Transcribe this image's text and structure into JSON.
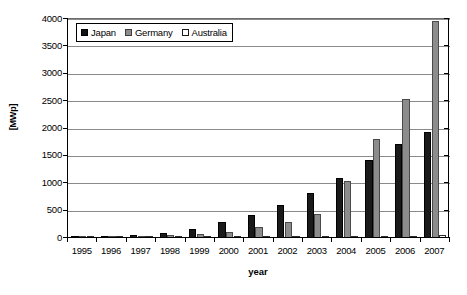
{
  "chart_data": {
    "type": "bar",
    "title": "",
    "xlabel": "year",
    "ylabel": "[MWp]",
    "ylim": [
      0,
      4000
    ],
    "ytick_step": 500,
    "yticks": [
      "4000",
      "3500",
      "3000",
      "2500",
      "2000",
      "1500",
      "1000",
      "500",
      "0"
    ],
    "grid": true,
    "legend_position": "top-left-inside",
    "categories": [
      "1995",
      "1996",
      "1997",
      "1998",
      "1999",
      "2000",
      "2001",
      "2002",
      "2003",
      "2004",
      "2005",
      "2006",
      "2007"
    ],
    "series": [
      {
        "name": "Japan",
        "color": "#1a1a1a",
        "values": [
          16,
          22,
          60,
          92,
          170,
          300,
          425,
          610,
          830,
          1100,
          1420,
          1710,
          1940
        ]
      },
      {
        "name": "Germany",
        "color": "#8c8c8c",
        "values": [
          12,
          20,
          42,
          54,
          70,
          115,
          205,
          290,
          440,
          1040,
          1800,
          2540,
          3960
        ]
      },
      {
        "name": "Australia",
        "color": "#ffffff",
        "values": [
          7,
          8,
          9,
          10,
          12,
          15,
          19,
          23,
          27,
          32,
          38,
          45,
          52
        ]
      }
    ]
  },
  "legend": {
    "items": [
      {
        "label": "Japan",
        "swatch": "black-square-icon"
      },
      {
        "label": "Germany",
        "swatch": "gray-square-icon"
      },
      {
        "label": "Australia",
        "swatch": "white-square-icon"
      }
    ]
  }
}
